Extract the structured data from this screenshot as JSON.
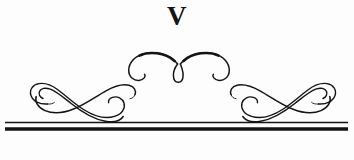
{
  "page": {
    "kind": "chapter-heading-ornament",
    "width": 354,
    "height": 160,
    "background_color": "#fdfdfd",
    "ink_color": "#141414"
  },
  "heading": {
    "chapter_numeral": "V",
    "numeral_system": "roman",
    "numeral_value": 5
  },
  "ornament": {
    "center_flourish": {
      "name": "double-arc-with-teardrop",
      "x_start": 128,
      "x_end": 230,
      "y_top": 52,
      "y_bottom": 82
    },
    "left_swash": {
      "name": "triple-stroke-s-swash",
      "x_start": 22,
      "x_end": 136,
      "y_top": 82,
      "y_bottom": 118
    },
    "right_swash": {
      "name": "triple-stroke-s-swash-mirrored",
      "x_start": 232,
      "x_end": 344,
      "y_top": 82,
      "y_bottom": 118
    }
  },
  "rules": {
    "x_start": 5,
    "x_end": 348,
    "thin_rule_y": 122.5,
    "thin_rule_weight": 1.4,
    "thick_rule_y": 129,
    "thick_rule_weight": 3.4
  }
}
